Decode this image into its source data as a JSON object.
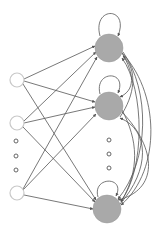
{
  "diagram": {
    "type": "recurrent-neural-network",
    "colors": {
      "input_stroke": "#c8c8c8",
      "hidden_fill": "#a9a9a9",
      "edge": "#555555",
      "ellipsis": "#666666"
    },
    "input_nodes": [
      {
        "id": "in1",
        "cx": 17,
        "cy": 80,
        "r": 7
      },
      {
        "id": "in2",
        "cx": 17,
        "cy": 123,
        "r": 7
      },
      {
        "id": "in3",
        "cx": 17,
        "cy": 193,
        "r": 7
      }
    ],
    "input_ellipsis": [
      {
        "cx": 16,
        "cy": 141
      },
      {
        "cx": 16,
        "cy": 156
      },
      {
        "cx": 16,
        "cy": 170
      }
    ],
    "hidden_nodes": [
      {
        "id": "h1",
        "cx": 109,
        "cy": 48,
        "r": 14
      },
      {
        "id": "h2",
        "cx": 109,
        "cy": 106,
        "r": 14
      },
      {
        "id": "h3",
        "cx": 107,
        "cy": 209,
        "r": 14
      }
    ],
    "hidden_ellipsis": [
      {
        "cx": 109,
        "cy": 140
      },
      {
        "cx": 109,
        "cy": 154
      },
      {
        "cx": 109,
        "cy": 168
      }
    ]
  }
}
